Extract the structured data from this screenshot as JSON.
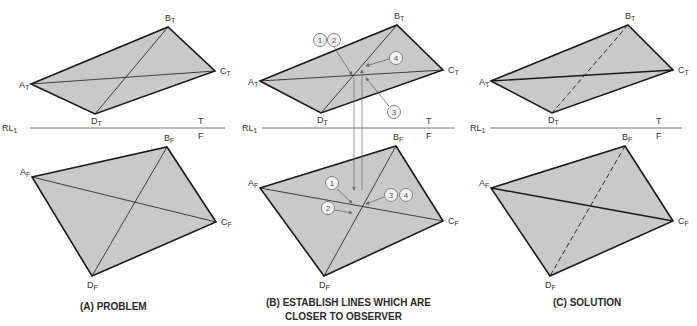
{
  "colors": {
    "fill": "#c9c9c9",
    "edge": "#1a1a1a",
    "line": "#555555",
    "callout": "#777777"
  },
  "reference_line": {
    "label": "RL",
    "sub": "1",
    "top_tag": "T",
    "bottom_tag": "F"
  },
  "panels": [
    {
      "id": "A",
      "caption": "(A) PROBLEM",
      "diagonal_style": "solid",
      "top": {
        "A": [
          31,
          84
        ],
        "B": [
          168,
          27
        ],
        "C": [
          215,
          71
        ],
        "D": [
          95,
          114
        ]
      },
      "front": {
        "A": [
          32,
          177
        ],
        "B": [
          167,
          147
        ],
        "C": [
          216,
          222
        ],
        "D": [
          92,
          276
        ]
      },
      "rl": {
        "x1": 30,
        "x2": 225,
        "y": 128,
        "label_x": 2,
        "tag_x": 198
      }
    },
    {
      "id": "B",
      "caption": "(B) ESTABLISH LINES WHICH ARE",
      "caption2": "CLOSER TO OBSERVER",
      "diagonal_style": "solid",
      "top": {
        "A": [
          260,
          81
        ],
        "B": [
          397,
          25
        ],
        "C": [
          443,
          70
        ],
        "D": [
          321,
          113
        ]
      },
      "front": {
        "A": [
          260,
          188
        ],
        "B": [
          396,
          146
        ],
        "C": [
          443,
          221
        ],
        "D": [
          324,
          276
        ]
      },
      "rl": {
        "x1": 262,
        "x2": 455,
        "y": 128,
        "label_x": 242,
        "tag_x": 426
      },
      "projectors": [
        {
          "x": 354,
          "y1": 77,
          "y2": 190,
          "dir": "down"
        },
        {
          "x": 362,
          "y1": 190,
          "y2": 70,
          "dir": "up"
        }
      ],
      "callouts_top": [
        {
          "n": "1",
          "cx": 320,
          "cy": 40
        },
        {
          "n": "2",
          "cx": 334,
          "cy": 40
        },
        {
          "n": "4",
          "cx": 396,
          "cy": 58
        },
        {
          "n": "3",
          "cx": 394,
          "cy": 112
        }
      ],
      "callouts_front": [
        {
          "n": "1",
          "cx": 332,
          "cy": 183
        },
        {
          "n": "2",
          "cx": 328,
          "cy": 208
        },
        {
          "n": "3",
          "cx": 391,
          "cy": 195
        },
        {
          "n": "4",
          "cx": 406,
          "cy": 195
        }
      ]
    },
    {
      "id": "C",
      "caption": "(C) SOLUTION",
      "diagonal_style": "dashed-BD",
      "top": {
        "A": [
          491,
          81
        ],
        "B": [
          628,
          25
        ],
        "C": [
          673,
          70
        ],
        "D": [
          552,
          113
        ]
      },
      "front": {
        "A": [
          491,
          188
        ],
        "B": [
          625,
          146
        ],
        "C": [
          673,
          221
        ],
        "D": [
          550,
          276
        ]
      },
      "rl": {
        "x1": 490,
        "x2": 682,
        "y": 128,
        "label_x": 470,
        "tag_x": 656
      }
    }
  ],
  "vertex_labels": {
    "top_suffix": "T",
    "front_suffix": "F",
    "names": [
      "A",
      "B",
      "C",
      "D"
    ]
  }
}
